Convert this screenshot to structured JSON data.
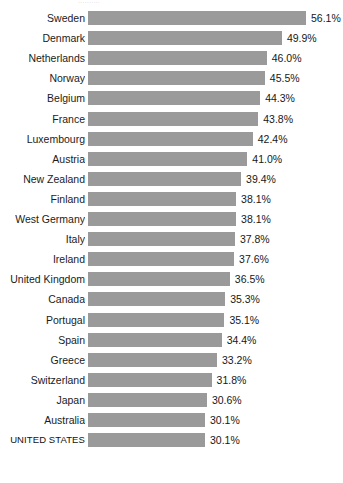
{
  "header": {
    "title_sliver": "··········"
  },
  "chart_data": {
    "type": "bar",
    "orientation": "horizontal",
    "title": "",
    "xlabel": "",
    "ylabel": "",
    "grid": false,
    "legend": false,
    "value_suffix": "%",
    "xlim": [
      0,
      56.1
    ],
    "bar_color": "#9a9a9a",
    "background_color": "#ffffff",
    "label_color": "#1b1b1b",
    "categories": [
      "Sweden",
      "Denmark",
      "Netherlands",
      "Norway",
      "Belgium",
      "France",
      "Luxembourg",
      "Austria",
      "New Zealand",
      "Finland",
      "West Germany",
      "Italy",
      "Ireland",
      "United Kingdom",
      "Canada",
      "Portugal",
      "Spain",
      "Greece",
      "Switzerland",
      "Japan",
      "Australia",
      "UNITED STATES"
    ],
    "values": [
      56.1,
      49.9,
      46.0,
      45.5,
      44.3,
      43.8,
      42.4,
      41.0,
      39.4,
      38.1,
      38.1,
      37.8,
      37.6,
      36.5,
      35.3,
      35.1,
      34.4,
      33.2,
      31.8,
      30.6,
      30.1,
      30.1
    ],
    "value_labels": [
      "56.1%",
      "49.9%",
      "46.0%",
      "45.5%",
      "44.3%",
      "43.8%",
      "42.4%",
      "41.0%",
      "39.4%",
      "38.1%",
      "38.1%",
      "37.8%",
      "37.6%",
      "36.5%",
      "35.3%",
      "35.1%",
      "34.4%",
      "33.2%",
      "31.8%",
      "30.6%",
      "30.1%",
      "30.1%"
    ],
    "emphasized_category": "UNITED STATES"
  },
  "layout": {
    "bar_origin_x": 88,
    "first_bar_top": 11,
    "row_pitch": 20.1,
    "bar_height": 14,
    "px_per_percent": 3.886,
    "value_gap": 5,
    "label_right_edge": 85
  }
}
